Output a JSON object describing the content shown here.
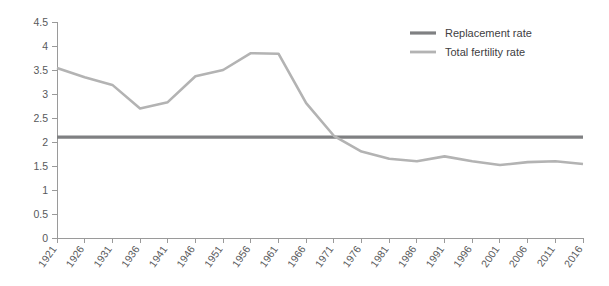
{
  "chart_data": {
    "type": "line",
    "title": "",
    "subtitle": "",
    "xlabel": "",
    "ylabel": "",
    "xlim": [
      1921,
      2016
    ],
    "ylim": [
      0,
      4.5
    ],
    "grid": false,
    "legend_position": "top-right",
    "x": [
      1921,
      1926,
      1931,
      1936,
      1941,
      1946,
      1951,
      1956,
      1961,
      1966,
      1971,
      1976,
      1981,
      1986,
      1991,
      1996,
      2001,
      2006,
      2011,
      2016
    ],
    "categories": [
      "1921",
      "1926",
      "1931",
      "1936",
      "1941",
      "1946",
      "1951",
      "1956",
      "1961",
      "1966",
      "1971",
      "1976",
      "1981",
      "1986",
      "1991",
      "1996",
      "2001",
      "2006",
      "2011",
      "2016"
    ],
    "ytick_labels": [
      "0",
      "0.5",
      "1",
      "1.5",
      "2",
      "2.5",
      "3",
      "3.5",
      "4",
      "4.5"
    ],
    "ytick_values": [
      0,
      0.5,
      1,
      1.5,
      2,
      2.5,
      3,
      3.5,
      4,
      4.5
    ],
    "series": [
      {
        "name": "Replacement rate",
        "color": "#7f8082",
        "values": [
          2.1,
          2.1,
          2.1,
          2.1,
          2.1,
          2.1,
          2.1,
          2.1,
          2.1,
          2.1,
          2.1,
          2.1,
          2.1,
          2.1,
          2.1,
          2.1,
          2.1,
          2.1,
          2.1,
          2.1
        ]
      },
      {
        "name": "Total fertility rate",
        "color": "#b3b3b3",
        "values": [
          3.54,
          3.35,
          3.19,
          2.7,
          2.83,
          3.37,
          3.5,
          3.85,
          3.84,
          2.81,
          2.13,
          1.8,
          1.65,
          1.6,
          1.7,
          1.6,
          1.52,
          1.58,
          1.6,
          1.54
        ]
      }
    ]
  },
  "legend": {
    "items": [
      {
        "label": "Replacement rate",
        "color": "#7f8082"
      },
      {
        "label": "Total fertility rate",
        "color": "#b3b3b3"
      }
    ]
  }
}
